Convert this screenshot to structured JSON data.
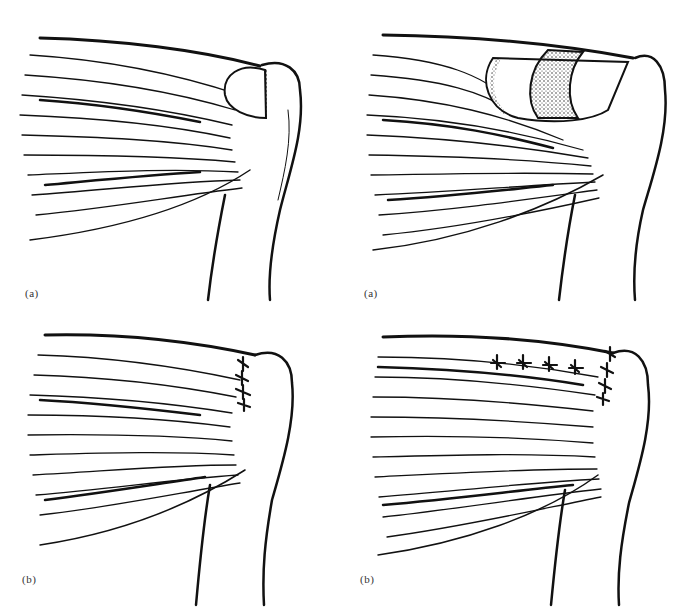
{
  "figure": {
    "colors": {
      "ink": "#111111",
      "background": "#ffffff",
      "label": "#333333"
    },
    "panels": [
      {
        "id": "top-left",
        "label": "(a)",
        "description": "Muscle with small oval rotator cuff defect near humeral head"
      },
      {
        "id": "top-right",
        "label": "(a)",
        "description": "Muscle with large retracted cuff defect exposing stippled humeral head"
      },
      {
        "id": "bottom-left",
        "label": "(b)",
        "description": "Repair with vertical row of sutures at greater tuberosity"
      },
      {
        "id": "bottom-right",
        "label": "(b)",
        "description": "Repair with horizontal side-to-side sutures and vertical row at tuberosity"
      }
    ]
  }
}
